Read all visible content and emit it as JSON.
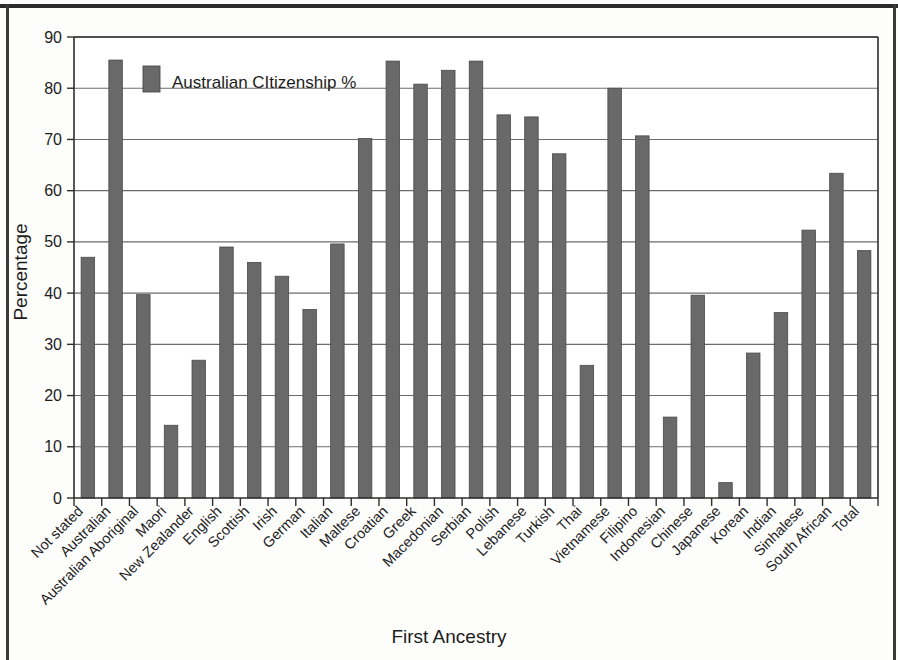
{
  "chart_data": {
    "type": "bar",
    "title": "",
    "xlabel": "First Ancestry",
    "ylabel": "Percentage",
    "ylim": [
      0,
      90
    ],
    "ytick_step": 10,
    "yticks": [
      0,
      10,
      20,
      30,
      40,
      50,
      60,
      70,
      80,
      90
    ],
    "grid": true,
    "legend_position": "inside-top-left",
    "bar_color": "#696969",
    "axis_color": "#2e2e2e",
    "grid_color": "#6d6d6d",
    "series": [
      {
        "name": "Australian CItizenship %",
        "values": [
          47.0,
          85.5,
          39.7,
          14.2,
          26.9,
          49.0,
          46.0,
          43.3,
          36.8,
          49.6,
          70.2,
          85.3,
          80.8,
          83.5,
          85.3,
          74.8,
          74.4,
          67.2,
          25.9,
          80.0,
          70.7,
          15.8,
          39.6,
          3.0,
          28.3,
          36.2,
          52.3,
          63.4,
          48.3
        ]
      }
    ],
    "categories": [
      "Not stated",
      "Australian",
      "Australian Aboriginal",
      "Maori",
      "New Zealander",
      "English",
      "Scottish",
      "Irish",
      "German",
      "Italian",
      "Maltese",
      "Croatian",
      "Greek",
      "Macedonian",
      "Serbian",
      "Polish",
      "Lebanese",
      "Turkish",
      "Thai",
      "Vietnamese",
      "Filipino",
      "Indonesian",
      "Chinese",
      "Japanese",
      "Korean",
      "Indian",
      "Sinhalese",
      "South African",
      "Total"
    ]
  },
  "legend": {
    "label": "Australian CItizenship %"
  }
}
